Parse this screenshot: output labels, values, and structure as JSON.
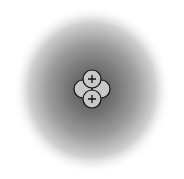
{
  "diagram": {
    "type": "atom-model",
    "electron_cloud": {
      "center": [
        92,
        90
      ],
      "radius_x": 79,
      "radius_y": 84,
      "inner_color": "#5a5a5a",
      "outer_color": "#ffffff"
    },
    "nucleus": {
      "particles": [
        {
          "kind": "neutron",
          "cx": 83,
          "cy": 89,
          "r": 9,
          "label": ""
        },
        {
          "kind": "neutron",
          "cx": 101,
          "cy": 89,
          "r": 9,
          "label": ""
        },
        {
          "kind": "proton",
          "cx": 92,
          "cy": 79,
          "r": 9,
          "label": "+"
        },
        {
          "kind": "proton",
          "cx": 92,
          "cy": 99,
          "r": 9,
          "label": "+"
        }
      ],
      "fill": "#c8c8c8",
      "stroke": "#111111"
    }
  }
}
